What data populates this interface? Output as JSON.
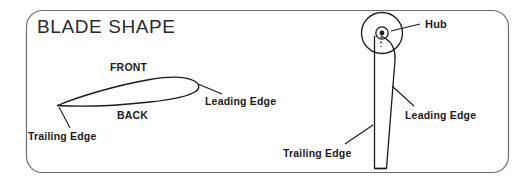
{
  "figure": {
    "title": "BLADE SHAPE",
    "background_color": "#ffffff",
    "border_color": "#6e6e6e",
    "line_color": "#1a1a1a",
    "text_color": "#1a1a1a"
  },
  "labels": {
    "front": "FRONT",
    "back": "BACK",
    "trailing_edge_left": "Trailing Edge",
    "leading_edge_left": "Leading Edge",
    "hub": "Hub",
    "trailing_edge_right": "Trailing Edge",
    "leading_edge_right": "Leading Edge"
  },
  "views": {
    "cross_section": {
      "name": "airfoil-cross-section",
      "description": "Cambered airfoil profile, sharp trailing edge at left, rounded leading edge at right",
      "surfaces": [
        "FRONT",
        "BACK"
      ]
    },
    "planform": {
      "name": "blade-planform",
      "description": "Tapered blade attached to circular hub at top",
      "parts": [
        "Hub",
        "Leading Edge",
        "Trailing Edge"
      ]
    }
  }
}
